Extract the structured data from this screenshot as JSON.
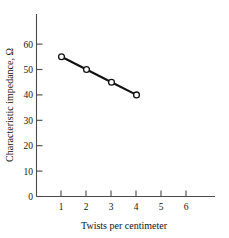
{
  "chart_data": {
    "type": "line",
    "title": "",
    "xlabel": "Twists per centimeter",
    "ylabel": "Characteristic impedance, Ω",
    "x": [
      1,
      2,
      3,
      4
    ],
    "values": [
      55,
      50,
      45,
      40
    ],
    "series": [
      {
        "name": "Characteristic impedance",
        "x": [
          1,
          2,
          3,
          4
        ],
        "values": [
          55,
          50,
          45,
          40
        ],
        "marker": "open-circle",
        "line_color": "#111111",
        "marker_fill": "#ffffff"
      }
    ],
    "xlim": [
      0,
      6.9
    ],
    "ylim": [
      0,
      68
    ],
    "xticks": [
      1,
      2,
      3,
      4,
      5,
      6
    ],
    "xtick_labels": [
      "1",
      "2",
      "3",
      "4",
      "5",
      "6"
    ],
    "yticks": [
      0,
      10,
      20,
      30,
      40,
      50,
      60
    ],
    "ytick_labels": [
      "0",
      "10",
      "20",
      "30",
      "40",
      "50",
      "60"
    ],
    "grid": false,
    "legend": false,
    "legend_position": "none"
  },
  "axes": {
    "y_title": "Characteristic impedance, Ω",
    "x_title": "Twists per centimeter"
  },
  "ytick_labels": {
    "t0": "0",
    "t1": "10",
    "t2": "20",
    "t3": "30",
    "t4": "40",
    "t5": "50",
    "t6": "60"
  },
  "xtick_labels": {
    "t1": "1",
    "t2": "2",
    "t3": "3",
    "t4": "4",
    "t5": "5",
    "t6": "6"
  }
}
